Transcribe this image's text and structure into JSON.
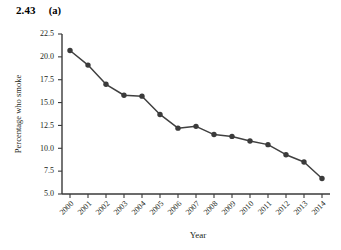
{
  "figure": {
    "number": "2.43",
    "part": "(a)"
  },
  "chart_data": {
    "type": "line",
    "title": "",
    "xlabel": "Year",
    "ylabel": "Percentage who smoke",
    "categories": [
      "2000",
      "2001",
      "2002",
      "2003",
      "2004",
      "2005",
      "2006",
      "2007",
      "2008",
      "2009",
      "2010",
      "2011",
      "2012",
      "2013",
      "2014"
    ],
    "values": [
      20.7,
      19.1,
      17.0,
      15.8,
      15.7,
      13.7,
      12.2,
      12.4,
      11.5,
      11.3,
      10.8,
      10.4,
      9.3,
      8.5,
      6.7
    ],
    "series": [
      {
        "name": "Percentage who smoke",
        "values": [
          20.7,
          19.1,
          17.0,
          15.8,
          15.7,
          13.7,
          12.2,
          12.4,
          11.5,
          11.3,
          10.8,
          10.4,
          9.3,
          8.5,
          6.7
        ]
      }
    ],
    "ylim": [
      5.0,
      22.5
    ],
    "yticks": [
      "5.0",
      "7.5",
      "10.0",
      "12.5",
      "15.0",
      "17.5",
      "20.0",
      "22.5"
    ],
    "ytick_values": [
      5.0,
      7.5,
      10.0,
      12.5,
      15.0,
      17.5,
      20.0,
      22.5
    ],
    "xtick_labels": [
      "2000",
      "2001",
      "2002",
      "2003",
      "2004",
      "2005",
      "2006",
      "2007",
      "2008",
      "2009",
      "2010",
      "2011",
      "2012",
      "2013",
      "2014"
    ],
    "grid": false,
    "legend": "none",
    "marker": "filled-circle",
    "line_color": "#404040",
    "marker_color": "#3b3b3b",
    "background_color": "#ffffff",
    "xtick_label_rotation_deg": -45
  }
}
